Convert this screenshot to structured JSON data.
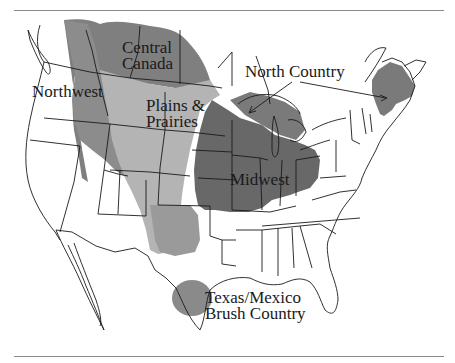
{
  "map": {
    "title": "",
    "regions": [
      {
        "id": "central-canada",
        "label_lines": [
          "Central",
          "Canada"
        ],
        "color": "#7f7f7f"
      },
      {
        "id": "northwest",
        "label_lines": [
          "Northwest"
        ],
        "color": "#8c8c8c"
      },
      {
        "id": "plains-prairies",
        "label_lines": [
          "Plains &",
          "Prairies"
        ],
        "color": "#b4b4b4"
      },
      {
        "id": "north-country",
        "label_lines": [
          "North Country"
        ],
        "color": "#7a7a7a"
      },
      {
        "id": "midwest",
        "label_lines": [
          "Midwest"
        ],
        "color": "#686868"
      },
      {
        "id": "texas-mexico",
        "label_lines": [
          "Texas/Mexico",
          "Brush Country"
        ],
        "color": "#8a8a8a"
      }
    ],
    "colors": {
      "outline": "#1a1a1a",
      "land": "#ffffff",
      "rule": "#8a8a8a"
    }
  }
}
